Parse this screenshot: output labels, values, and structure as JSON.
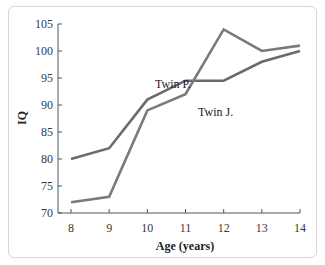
{
  "chart_data": {
    "type": "line",
    "title": "",
    "xlabel": "Age (years)",
    "ylabel": "IQ",
    "x": [
      8,
      9,
      10,
      11,
      12,
      13,
      14
    ],
    "xlim": [
      8,
      14
    ],
    "ylim": [
      70,
      105
    ],
    "yticks": [
      70,
      75,
      80,
      85,
      90,
      95,
      100,
      105
    ],
    "xticks": [
      8,
      9,
      10,
      11,
      12,
      13,
      14
    ],
    "grid": false,
    "legend": "inline labels",
    "series": [
      {
        "name": "Twin P.",
        "values": [
          80,
          82,
          91,
          94.5,
          94.5,
          98,
          100
        ],
        "color": "#6b6b6b"
      },
      {
        "name": "Twin J.",
        "values": [
          72,
          73,
          89,
          92,
          104,
          100,
          101
        ],
        "color": "#7a7a7a"
      }
    ],
    "annotations": [
      {
        "text": "Twin P.",
        "x": 10.2,
        "y": 93
      },
      {
        "text": "Twin J.",
        "x": 11.1,
        "y": 88.5
      }
    ]
  },
  "labels": {
    "xlabel": "Age (years)",
    "ylabel": "IQ",
    "twin_p": "Twin P.",
    "twin_j": "Twin J."
  }
}
